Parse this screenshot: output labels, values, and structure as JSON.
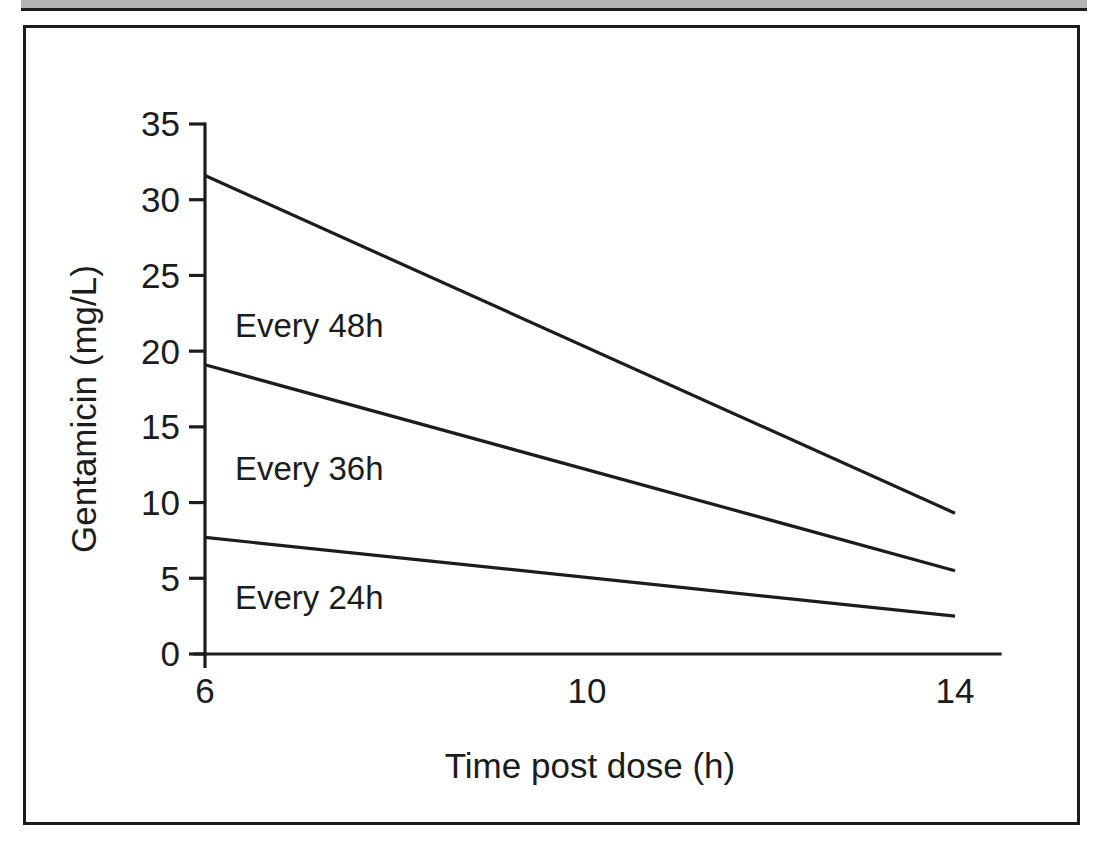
{
  "figure": {
    "background_color": "#ffffff",
    "frame_color": "#1c1c1c",
    "top_strip_color": "#b4b4b4"
  },
  "chart_data": {
    "type": "line",
    "title": "",
    "xlabel": "Time post dose (h)",
    "ylabel": "Gentamicin (mg/L)",
    "xlim": [
      6,
      14
    ],
    "ylim": [
      0,
      35
    ],
    "xticks": [
      6,
      10,
      14
    ],
    "xtick_labels": [
      "6",
      "10",
      "14"
    ],
    "yticks": [
      0,
      5,
      10,
      15,
      20,
      25,
      30,
      35
    ],
    "ytick_labels": [
      "0",
      "5",
      "10",
      "15",
      "20",
      "25",
      "30",
      "35"
    ],
    "grid": false,
    "legend_position": "inline-annotations",
    "line_color": "#1c1c1c",
    "x": [
      6,
      14
    ],
    "series": [
      {
        "name": "Every 48h",
        "values": [
          31.6,
          9.3
        ]
      },
      {
        "name": "Every 36h",
        "values": [
          19.1,
          5.5
        ]
      },
      {
        "name": "Every 24h",
        "values": [
          7.7,
          2.5
        ]
      }
    ],
    "annotations": [
      {
        "text": "Every 48h",
        "x": 6.5,
        "y": 21.6
      },
      {
        "text": "Every 36h",
        "x": 6.5,
        "y": 13.5
      },
      {
        "text": "Every 24h",
        "x": 6.5,
        "y": 4.8
      }
    ]
  }
}
